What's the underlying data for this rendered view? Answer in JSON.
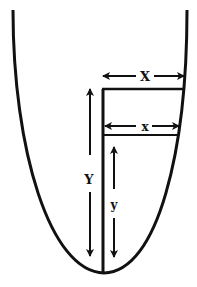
{
  "diagram": {
    "type": "parabolic bowl cross-section",
    "colors": {
      "stroke": "#111111",
      "background": "#ffffff"
    },
    "labels": {
      "big_width": "X",
      "small_width": "x",
      "big_height": "Y",
      "small_height": "y"
    }
  }
}
